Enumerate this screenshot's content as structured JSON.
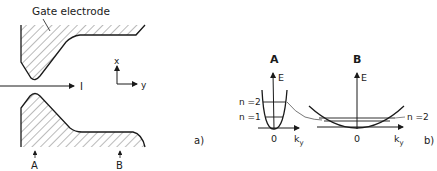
{
  "panel_a": {
    "gate_label": "Gate electrode",
    "current_label": "I",
    "axis_x": "x",
    "axis_y": "y",
    "marker_a": "A",
    "marker_b": "B",
    "panel_label": "a)"
  },
  "panel_b": {
    "section_a": {
      "title": "A",
      "energy_axis": "E",
      "origin": "0",
      "k_axis": "k",
      "k_sub": "y",
      "levels": [
        "n =2",
        "n =1"
      ]
    },
    "section_b": {
      "title": "B",
      "energy_axis": "E",
      "origin": "0",
      "k_axis": "k",
      "k_sub": "y",
      "level": "n =2"
    },
    "panel_label": "b)"
  },
  "colors": {
    "ink": "#1a1a1a",
    "hatch": "#555555",
    "background": "#ffffff"
  }
}
